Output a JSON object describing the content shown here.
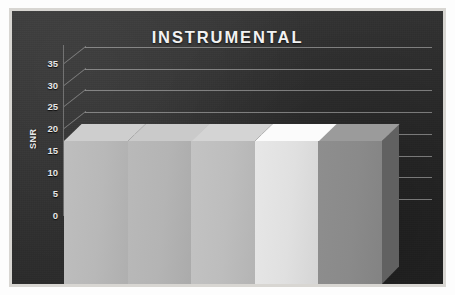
{
  "chart_data": {
    "type": "bar",
    "title": "INSTRUMENTAL",
    "xlabel": "ATTACKS",
    "ylabel": "SNR",
    "categories": [
      "Cropping",
      "Amplification",
      "Echo",
      "Noise (AWGN)",
      "High Bass"
    ],
    "values": [
      33,
      33,
      33,
      33,
      33
    ],
    "ylim": [
      0,
      35
    ],
    "yticks": [
      35,
      30,
      25,
      20,
      15,
      10,
      5,
      0
    ],
    "grid": true,
    "legend_position": "bottom",
    "style": "3d-column",
    "series_colors": [
      "#b8b8b8",
      "#b4b4b4",
      "#bdbdbd",
      "#e0e0e0",
      "#8a8a8a"
    ],
    "annotations": []
  },
  "chart": {
    "title": "INSTRUMENTAL",
    "x_axis_title": "ATTACKS",
    "y_axis_title": "SNR",
    "y_ticks": [
      "35",
      "30",
      "25",
      "20",
      "15",
      "10",
      "5",
      "0"
    ],
    "background_color": "#2e2e2e",
    "frame_color": "#d8d6d2",
    "text_color": "#ededed",
    "gridline_color": "#c8c8c8"
  },
  "legend": {
    "items": [
      {
        "label": "Cropping",
        "color": "#b8b8b8"
      },
      {
        "label": "Amplification",
        "color": "#b4b4b4"
      },
      {
        "label": "Echo",
        "color": "#bdbdbd"
      },
      {
        "label": "Noise (AWGN)",
        "color": "#e0e0e0"
      },
      {
        "label": "High Bass",
        "color": "#8a8a8a"
      }
    ]
  }
}
